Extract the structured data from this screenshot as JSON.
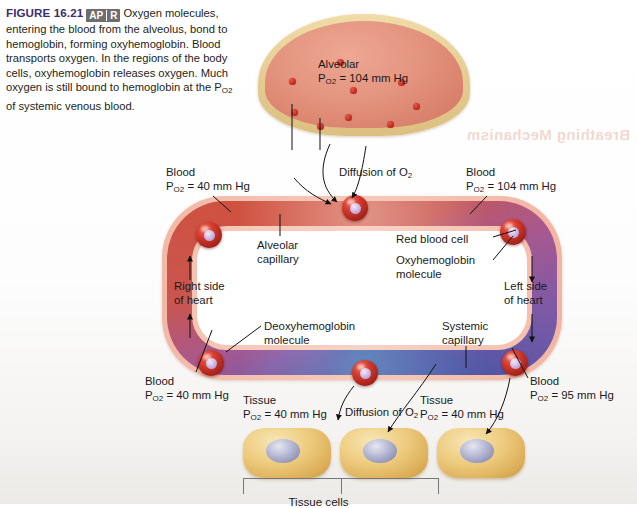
{
  "caption": {
    "figure_label": "FIGURE 16.21",
    "badge_left": "AP",
    "badge_right": "R",
    "body_part1": "Oxygen molecules, entering the blood from the alveolus, bond to hemoglobin, forming oxyhemoglobin. Blood transports oxygen. In the regions of the body cells, oxyhemoglobin releases oxygen. Much oxygen is still bound to hemoglobin at the P",
    "body_sub": "O2",
    "body_part2": " of systemic venous blood."
  },
  "showthrough_text": "Breathing Mechanism",
  "alveolus": {
    "label_line1": "Alveolar",
    "label_line2_pre": "P",
    "label_line2_sub": "O2",
    "label_line2_post": " = 104 mm Hg",
    "oxygen_dot_count": 9
  },
  "labels": {
    "blood_right_heart": {
      "line1": "Blood",
      "pre": "P",
      "sub": "O2",
      "post": " = 40 mm Hg"
    },
    "blood_top_left": {
      "line1": "Blood",
      "pre": "P",
      "sub": "O2",
      "post": " = 104 mm Hg"
    },
    "blood_bottom_left": {
      "line1": "Blood",
      "pre": "P",
      "sub": "O2",
      "post": " = 40 mm Hg"
    },
    "blood_bottom_right": {
      "line1": "Blood",
      "pre": "P",
      "sub": "O2",
      "post": " = 95 mm Hg"
    },
    "tissue_left": {
      "line1": "Tissue",
      "pre": "P",
      "sub": "O2",
      "post": " = 40 mm Hg"
    },
    "tissue_right": {
      "line1": "Tissue",
      "pre": "P",
      "sub": "O2",
      "post": " = 40 mm Hg"
    },
    "diffusion_top_pre": "Diffusion of O",
    "diffusion_top_sub": "2",
    "diffusion_bottom_pre": "Diffusion of O",
    "diffusion_bottom_sub": "2",
    "alveolar_capillary_l1": "Alveolar",
    "alveolar_capillary_l2": "capillary",
    "systemic_capillary_l1": "Systemic",
    "systemic_capillary_l2": "capillary",
    "red_blood_cell": "Red blood cell",
    "oxyhemoglobin_l1": "Oxyhemoglobin",
    "oxyhemoglobin_l2": "molecule",
    "deoxyhemoglobin_l1": "Deoxyhemoglobin",
    "deoxyhemoglobin_l2": "molecule",
    "right_side_l1": "Right side",
    "right_side_l2": "of heart",
    "left_side_l1": "Left side",
    "left_side_l2": "of heart",
    "bottom_bracket_label": "Tissue cells"
  },
  "colors": {
    "caption_title": "#3b2d6e",
    "badge_bg": "#6e6e6e",
    "alveolus_wall": "#e8cf96",
    "alveolus_lumen": "#e49580",
    "oxygen_dot": "#c62a22",
    "deoxygenated_blood": "#2f5fa8",
    "oxygenated_blood": "#d2543f",
    "vessel_wall": "#f3b8a6",
    "rbc": "#d43a2c",
    "hemoglobin": "#cfb8e2",
    "tissue_cell": "#edcb7e",
    "tissue_nucleus": "#b9bcd6"
  }
}
